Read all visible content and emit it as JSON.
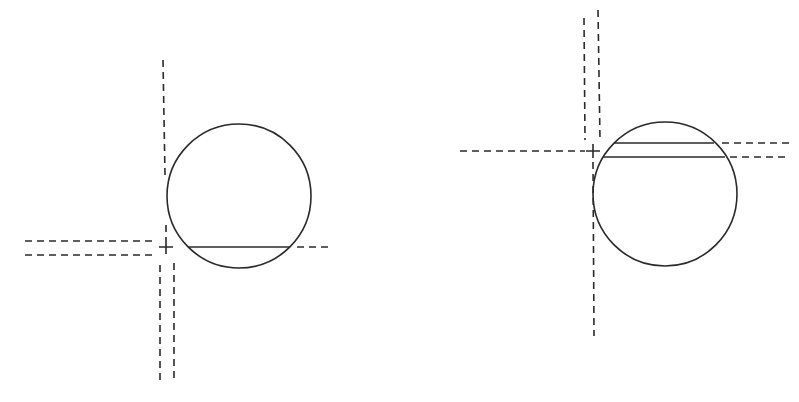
{
  "diagram": {
    "stroke_color": "#2a2a2a",
    "background": "#ffffff",
    "figures": [
      {
        "name": "left-figure",
        "circle": {
          "cx": 239,
          "cy": 196,
          "r": 72
        },
        "cross": {
          "x": 166,
          "y": 247,
          "size": 7
        },
        "chords": [
          {
            "x1": 188,
            "y1": 247,
            "x2": 290,
            "y2": 247
          }
        ],
        "dashed_lines": [
          {
            "id": "vertical-top",
            "x1": 163,
            "y1": 60,
            "x2": 165,
            "y2": 175
          },
          {
            "id": "vertical-stub",
            "x1": 166,
            "y1": 225,
            "x2": 166,
            "y2": 240
          },
          {
            "id": "horizontal-left-upper",
            "x1": 25,
            "y1": 241,
            "x2": 153,
            "y2": 241
          },
          {
            "id": "horizontal-left-lower",
            "x1": 25,
            "y1": 255,
            "x2": 153,
            "y2": 255
          },
          {
            "id": "chord-extension",
            "x1": 297,
            "y1": 247,
            "x2": 331,
            "y2": 247
          },
          {
            "id": "vertical-bottom-left",
            "x1": 160,
            "y1": 265,
            "x2": 160,
            "y2": 384
          },
          {
            "id": "vertical-bottom-right",
            "x1": 174,
            "y1": 263,
            "x2": 174,
            "y2": 382
          }
        ]
      },
      {
        "name": "right-figure",
        "circle": {
          "cx": 665,
          "cy": 194,
          "r": 72
        },
        "cross": {
          "x": 593,
          "y": 151,
          "size": 7
        },
        "chords": [
          {
            "x1": 614,
            "y1": 143,
            "x2": 714,
            "y2": 143
          },
          {
            "x1": 603,
            "y1": 157,
            "x2": 725,
            "y2": 157
          }
        ],
        "dashed_lines": [
          {
            "id": "vertical-top-left",
            "x1": 584,
            "y1": 18,
            "x2": 585,
            "y2": 140
          },
          {
            "id": "vertical-top-right",
            "x1": 598,
            "y1": 10,
            "x2": 600,
            "y2": 140
          },
          {
            "id": "horizontal-left",
            "x1": 460,
            "y1": 151,
            "x2": 585,
            "y2": 151
          },
          {
            "id": "chord1-extension",
            "x1": 722,
            "y1": 143,
            "x2": 789,
            "y2": 143
          },
          {
            "id": "chord2-extension",
            "x1": 730,
            "y1": 157,
            "x2": 789,
            "y2": 157
          },
          {
            "id": "vertical-bottom",
            "x1": 593,
            "y1": 162,
            "x2": 594,
            "y2": 336
          }
        ]
      }
    ]
  }
}
